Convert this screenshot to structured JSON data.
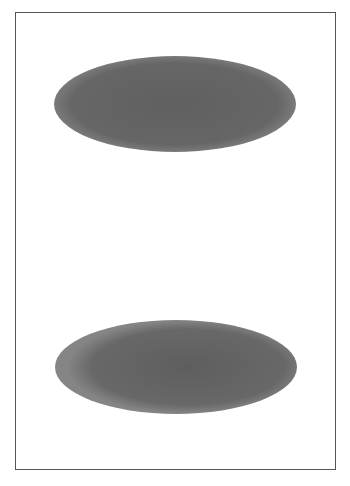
{
  "page": {
    "background": "#ffffff",
    "frame_color": "#555555"
  },
  "shapes": [
    {
      "name": "top-ellipse",
      "cx": 175,
      "cy": 104,
      "rx": 121,
      "ry": 48,
      "fill_center": "#606060",
      "fill_edge": "#7a7a7a"
    },
    {
      "name": "bottom-ellipse",
      "cx": 176,
      "cy": 367,
      "rx": 121,
      "ry": 47,
      "fill_center": "#5e5e5e",
      "fill_edge": "#858585"
    }
  ]
}
